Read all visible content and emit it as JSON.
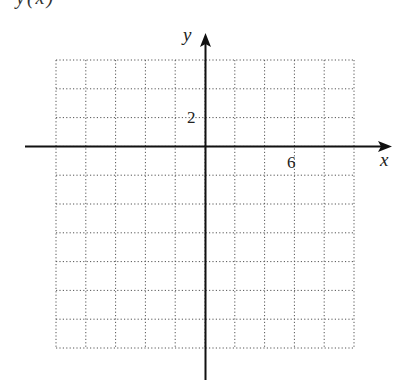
{
  "title_fragment": "y(x)",
  "chart_data": {
    "type": "scatter",
    "title": "",
    "xlabel": "x",
    "ylabel": "y",
    "grid": true,
    "grid_style": "dotted",
    "x_tick_labels": [
      {
        "value": 6,
        "label": "6"
      }
    ],
    "y_tick_labels": [
      {
        "value": 2,
        "label": "2"
      }
    ],
    "xlim": [
      -10,
      10
    ],
    "ylim": [
      -14,
      6
    ],
    "grid_step": 2,
    "series": []
  },
  "axes": {
    "x_label": "x",
    "y_label": "y",
    "x_tick": "6",
    "y_tick": "2"
  }
}
